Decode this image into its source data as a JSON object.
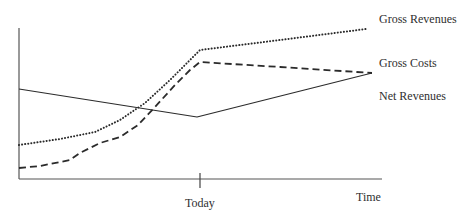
{
  "chart_data": {
    "type": "line",
    "title": "",
    "xlabel": "Time",
    "ylabel": "",
    "x_ticks": [
      {
        "label": "Today",
        "px": 200
      }
    ],
    "grid": false,
    "legend": "inline labels at right end of each line",
    "axis_px": {
      "x0": 19,
      "y0": 179,
      "x1": 382,
      "ytop": 28
    },
    "series": [
      {
        "name": "Gross Revenues",
        "style": "dotted",
        "color": "#2b2b2b",
        "label_px": [
          379,
          12
        ],
        "points_px": [
          [
            19,
            145
          ],
          [
            60,
            139
          ],
          [
            95,
            132
          ],
          [
            120,
            120
          ],
          [
            145,
            103
          ],
          [
            170,
            80
          ],
          [
            200,
            50
          ],
          [
            280,
            40
          ],
          [
            366,
            29
          ]
        ]
      },
      {
        "name": "Gross Costs",
        "style": "dashed",
        "color": "#2b2b2b",
        "label_px": [
          379,
          56
        ],
        "points_px": [
          [
            19,
            168
          ],
          [
            40,
            166
          ],
          [
            60,
            162
          ],
          [
            70,
            160
          ],
          [
            80,
            153
          ],
          [
            100,
            143
          ],
          [
            120,
            137
          ],
          [
            138,
            125
          ],
          [
            155,
            107
          ],
          [
            175,
            85
          ],
          [
            190,
            70
          ],
          [
            200,
            62
          ],
          [
            280,
            67
          ],
          [
            372,
            73
          ]
        ]
      },
      {
        "name": "Net Revenues",
        "style": "solid",
        "color": "#2b2b2b",
        "label_px": [
          379,
          89
        ],
        "points_px": [
          [
            19,
            89
          ],
          [
            197,
            117
          ],
          [
            372,
            73
          ]
        ]
      }
    ]
  },
  "labels": {
    "gross_revenues": "Gross Revenues",
    "gross_costs": "Gross Costs",
    "net_revenues": "Net Revenues",
    "today": "Today",
    "time": "Time"
  }
}
